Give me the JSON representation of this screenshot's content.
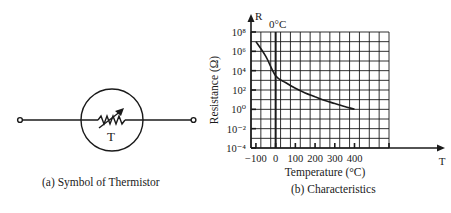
{
  "symbol": {
    "label": "T",
    "caption": "(a) Symbol of Thermistor"
  },
  "chart": {
    "caption": "(b) Characteristics"
  },
  "chart_data": {
    "type": "line",
    "title": "",
    "xlabel": "Temperature (°C)",
    "ylabel": "Resistance (Ω)",
    "x_axis_letter": "T",
    "y_axis_letter": "R",
    "annotation": "0°C",
    "x_ticks": [
      "−100",
      "0",
      "100",
      "200",
      "300",
      "400"
    ],
    "y_ticks": [
      "10⁻⁴",
      "10⁻²",
      "10⁰",
      "10²",
      "10⁴",
      "10⁶",
      "10⁸"
    ],
    "y_scale": "log",
    "xlim": [
      -150,
      500
    ],
    "ylim": [
      0.0001,
      100000000.0
    ],
    "grid": true,
    "series": [
      {
        "name": "Thermistor resistance",
        "x": [
          -100,
          -50,
          0,
          50,
          100,
          150,
          200,
          250,
          300,
          350,
          400
        ],
        "y": [
          10000000.0,
          300000.0,
          3000.0,
          600.0,
          150.0,
          50.0,
          20.0,
          8,
          4,
          2,
          1
        ]
      }
    ]
  }
}
